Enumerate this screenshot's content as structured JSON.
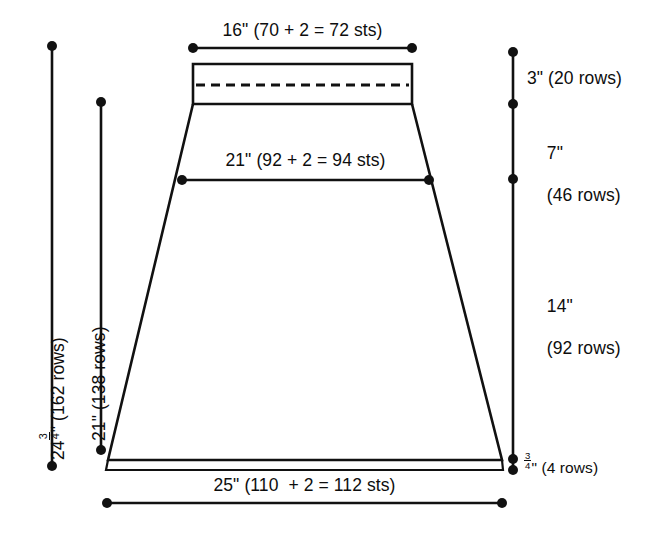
{
  "diagram": {
    "stroke_color": "#111111",
    "background": "#ffffff",
    "units": "inches"
  },
  "measurements": {
    "top_width": {
      "label": "16\" (70 + 2 = 72 sts)",
      "inches": 16,
      "stitches": 72,
      "stitch_math": "70 + 2 = 72"
    },
    "mid_width": {
      "label": "21\" (92 + 2 = 94 sts)",
      "inches": 21,
      "stitches": 94,
      "stitch_math": "92 + 2 = 94"
    },
    "bottom_width": {
      "label": "25\" (110  + 2 = 112 sts)",
      "inches": 25,
      "stitches": 112,
      "stitch_math": "110  + 2 = 112"
    },
    "band_height": {
      "label": "3\" (20 rows)",
      "inches": 3,
      "rows": 20
    },
    "upper_taper": {
      "label_line1": "7\"",
      "label_line2": "(46 rows)",
      "inches": 7,
      "rows": 46
    },
    "lower_taper": {
      "label_line1": "14\"",
      "label_line2": "(92 rows)",
      "inches": 14,
      "rows": 92
    },
    "hem_height": {
      "whole": "",
      "fraction_num": "3",
      "fraction_den": "4",
      "suffix": "\" (4 rows)",
      "inches": 0.75,
      "rows": 4
    },
    "total_height": {
      "whole": "24",
      "fraction_num": "3",
      "fraction_den": "4",
      "suffix": "\" (162 rows)",
      "inches": 24.75,
      "rows": 162
    },
    "body_height": {
      "label": "21\" (138 rows)",
      "inches": 21,
      "rows": 138
    }
  },
  "icons": {
    "dimension_endpoint": "dot-endpoint-icon",
    "dashed_fold": "dashed-fold-line-icon"
  }
}
